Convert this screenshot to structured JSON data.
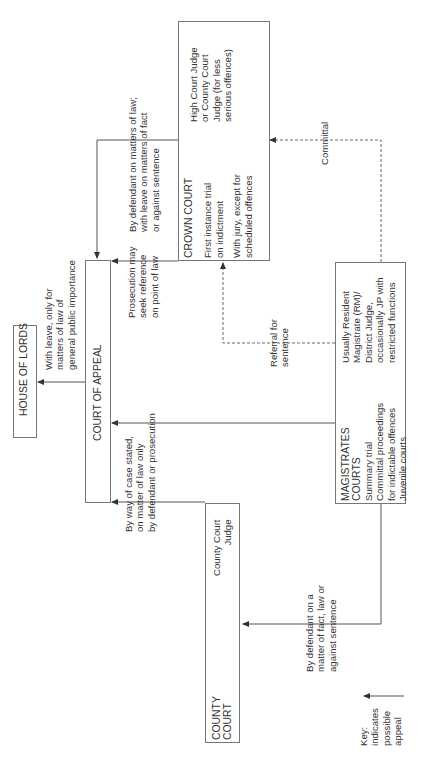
{
  "diagram": {
    "orientation": "rotated 90 degrees counter-clockwise",
    "nodes": {
      "house_of_lords": {
        "title": "HOUSE OF LORDS"
      },
      "court_of_appeal": {
        "title": "COURT OF APPEAL"
      },
      "crown_court": {
        "title": "CROWN COURT",
        "lines": [
          "First instance trial",
          "on indictment"
        ],
        "lines2": [
          "With jury, except for",
          "scheduled offences"
        ],
        "judge": [
          "High Court Judge",
          "or County Court",
          "Judge (for less",
          "serious offences)"
        ]
      },
      "magistrates_courts": {
        "title": [
          "MAGISTRATES",
          "COURTS"
        ],
        "functions": [
          "Summary trial",
          "Committal proceedings",
          "for indictable offences",
          "Juvenile courts"
        ],
        "judge": [
          "Usually Resident",
          "Magistrate (RM)/",
          "District Judge,",
          "occasionally JP with",
          "restricted functions"
        ]
      },
      "county_court": {
        "title": [
          "COUNTY",
          "COURT"
        ],
        "judge": [
          "County Court",
          "Judge"
        ]
      }
    },
    "edges": {
      "coa_to_hol": [
        "With leave, only for",
        "matters of law of",
        "general public importance"
      ],
      "crown_to_coa_defendant": [
        "By defendant on matters of law;",
        "with leave on matters of fact",
        "or against sentence"
      ],
      "crown_to_coa_prosecution": [
        "Prosecution may",
        "seek reference",
        "on point of law"
      ],
      "mag_to_coa_case_stated": [
        "By way of case stated,",
        "on matter of law only",
        "by defendant or prosecution"
      ],
      "mag_to_crown_committal": [
        "Committal"
      ],
      "mag_to_crown_referral": [
        "Referral for",
        "sentence"
      ],
      "mag_to_county": [
        "By defendant on a",
        "matter of fact, law or",
        "against sentence"
      ]
    },
    "key": {
      "label": [
        "Key:",
        "indicates",
        "possible",
        "appeal"
      ]
    }
  }
}
